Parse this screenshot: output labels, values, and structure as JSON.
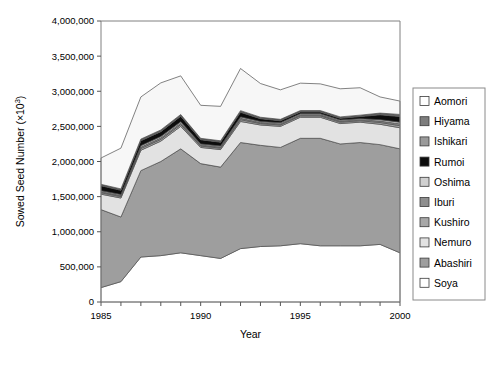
{
  "chart_data": {
    "type": "area",
    "title": "",
    "xlabel": "Year",
    "ylabel": "Sowed Seed Number (×10³)",
    "ylabel_parts": {
      "main": "Sowed Seed Number (×10",
      "sup": "3",
      "tail": ")"
    },
    "xlim": [
      1985,
      2000
    ],
    "ylim": [
      0,
      4000000
    ],
    "grid": false,
    "stacked": true,
    "legend_position": "right",
    "x": [
      1985,
      1986,
      1987,
      1988,
      1989,
      1990,
      1991,
      1992,
      1993,
      1994,
      1995,
      1996,
      1997,
      1998,
      1999,
      2000
    ],
    "xticklabels": [
      "1985",
      "",
      "",
      "",
      "",
      "1990",
      "",
      "",
      "",
      "",
      "1995",
      "",
      "",
      "",
      "",
      "2000"
    ],
    "yticklabels": [
      "0",
      "500,000",
      "1,000,000",
      "1,500,000",
      "2,000,000",
      "2,500,000",
      "3,000,000",
      "3,500,000",
      "4,000,000"
    ],
    "yticks": [
      0,
      500000,
      1000000,
      1500000,
      2000000,
      2500000,
      3000000,
      3500000,
      4000000
    ],
    "stack_order_bottom_to_top": [
      "Soya",
      "Abashiri",
      "Nemuro",
      "Kushiro",
      "Iburi",
      "Oshima",
      "Rumoi",
      "Ishikari",
      "Hiyama",
      "Aomori"
    ],
    "series": [
      {
        "name": "Soya",
        "color": "#ffffff",
        "values": [
          205000,
          290000,
          640000,
          660000,
          700000,
          660000,
          620000,
          760000,
          790000,
          800000,
          830000,
          800000,
          800000,
          800000,
          820000,
          700000
        ]
      },
      {
        "name": "Abashiri",
        "color": "#9e9e9e",
        "values": [
          1110000,
          920000,
          1230000,
          1340000,
          1480000,
          1310000,
          1300000,
          1510000,
          1440000,
          1400000,
          1500000,
          1530000,
          1450000,
          1470000,
          1420000,
          1480000
        ]
      },
      {
        "name": "Nemuro",
        "color": "#e2e2e2",
        "values": [
          220000,
          270000,
          290000,
          290000,
          320000,
          230000,
          250000,
          300000,
          290000,
          300000,
          300000,
          300000,
          290000,
          290000,
          290000,
          300000
        ]
      },
      {
        "name": "Kushiro",
        "color": "#a8a8a8",
        "values": [
          20000,
          20000,
          25000,
          25000,
          25000,
          20000,
          20000,
          25000,
          20000,
          20000,
          20000,
          20000,
          20000,
          20000,
          25000,
          30000
        ]
      },
      {
        "name": "Iburi",
        "color": "#8f8f8f",
        "values": [
          15000,
          15000,
          20000,
          20000,
          20000,
          15000,
          15000,
          20000,
          15000,
          15000,
          15000,
          15000,
          15000,
          15000,
          20000,
          25000
        ]
      },
      {
        "name": "Oshima",
        "color": "#d0d0d0",
        "values": [
          15000,
          15000,
          20000,
          20000,
          20000,
          15000,
          15000,
          20000,
          15000,
          15000,
          15000,
          15000,
          15000,
          15000,
          20000,
          25000
        ]
      },
      {
        "name": "Rumoi",
        "color": "#0d0d0d",
        "values": [
          70000,
          60000,
          70000,
          70000,
          80000,
          60000,
          55000,
          65000,
          40000,
          30000,
          25000,
          25000,
          25000,
          30000,
          70000,
          80000
        ]
      },
      {
        "name": "Ishikari",
        "color": "#9a9a9a",
        "values": [
          10000,
          10000,
          12000,
          12000,
          12000,
          10000,
          10000,
          12000,
          10000,
          10000,
          10000,
          10000,
          10000,
          10000,
          12000,
          15000
        ]
      },
      {
        "name": "Hiyama",
        "color": "#7d7d7d",
        "values": [
          10000,
          10000,
          12000,
          12000,
          12000,
          10000,
          10000,
          12000,
          10000,
          10000,
          10000,
          10000,
          10000,
          10000,
          12000,
          15000
        ]
      },
      {
        "name": "Aomori",
        "color": "#f7f7f7",
        "values": [
          375000,
          580000,
          600000,
          670000,
          550000,
          470000,
          490000,
          600000,
          480000,
          420000,
          390000,
          380000,
          400000,
          390000,
          230000,
          190000
        ]
      }
    ],
    "totals": [
      2050000,
      2190000,
      2919000,
      3119000,
      3219000,
      2800000,
      2785000,
      3324000,
      3110000,
      3020000,
      3115000,
      3095000,
      3035000,
      3050000,
      2919000,
      2860000
    ]
  },
  "legend": {
    "items": [
      {
        "label": "Aomori",
        "color": "#ffffff"
      },
      {
        "label": "Hiyama",
        "color": "#7d7d7d"
      },
      {
        "label": "Ishikari",
        "color": "#9a9a9a"
      },
      {
        "label": "Rumoi",
        "color": "#0d0d0d"
      },
      {
        "label": "Oshima",
        "color": "#d0d0d0"
      },
      {
        "label": "Iburi",
        "color": "#8f8f8f"
      },
      {
        "label": "Kushiro",
        "color": "#a8a8a8"
      },
      {
        "label": "Nemuro",
        "color": "#e2e2e2"
      },
      {
        "label": "Abashiri",
        "color": "#9e9e9e"
      },
      {
        "label": "Soya",
        "color": "#ffffff"
      }
    ]
  }
}
